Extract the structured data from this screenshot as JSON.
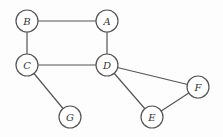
{
  "graph": {
    "nodes": [
      {
        "id": "A",
        "label": "A",
        "x": 107,
        "y": 21
      },
      {
        "id": "B",
        "label": "B",
        "x": 27,
        "y": 21
      },
      {
        "id": "C",
        "label": "C",
        "x": 27,
        "y": 65
      },
      {
        "id": "D",
        "label": "D",
        "x": 107,
        "y": 65
      },
      {
        "id": "E",
        "label": "E",
        "x": 152,
        "y": 117
      },
      {
        "id": "F",
        "label": "F",
        "x": 198,
        "y": 87
      },
      {
        "id": "G",
        "label": "G",
        "x": 70,
        "y": 117
      }
    ],
    "edges": [
      [
        "B",
        "A"
      ],
      [
        "B",
        "C"
      ],
      [
        "A",
        "D"
      ],
      [
        "C",
        "D"
      ],
      [
        "C",
        "G"
      ],
      [
        "D",
        "F"
      ],
      [
        "D",
        "E"
      ],
      [
        "E",
        "F"
      ]
    ],
    "node_radius": 11,
    "colors": {
      "stroke": "#555555",
      "fill": "#ffffff",
      "text": "#333333"
    }
  }
}
